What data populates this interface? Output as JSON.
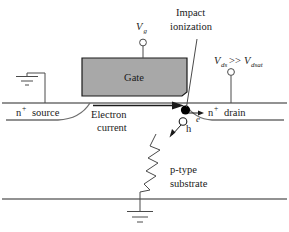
{
  "figure": {
    "background_color": "#ffffff"
  },
  "colors": {
    "gate_fill": "#a8a8a8",
    "gate_stroke": "#1a1a1a",
    "surface_line": "#6e6e6e",
    "text": "#1a1a1a",
    "carrier_electron": "#000000",
    "carrier_hole_fill": "#ffffff"
  },
  "labels": {
    "gate": "Gate",
    "gate_voltage": "V",
    "gate_voltage_sub": "g",
    "drain_bias_v1": "V",
    "drain_bias_v1_sub": "ds",
    "drain_bias_op": ">>",
    "drain_bias_v2": "V",
    "drain_bias_v2_sub": "dsat",
    "impact_line1": "Impact",
    "impact_line2": "ionization",
    "source_n": "n",
    "source_sup": "+",
    "source_word": "source",
    "drain_n": "n",
    "drain_sup": "+",
    "drain_word": "drain",
    "electron_current_line1": "Electron",
    "electron_current_line2": "current",
    "carrier_electron": "e",
    "carrier_hole": "h",
    "substrate_line1": "p-type",
    "substrate_line2": "substrate"
  },
  "elements": {
    "ground_source": "ground-symbol",
    "ground_substrate": "ground-symbol",
    "resistor": "zigzag-resistor",
    "terminal_gate": "open-circle-terminal",
    "terminal_drain": "open-circle-terminal",
    "current_arrow": "right-arrow",
    "electron_arrow": "right-arrow",
    "hole_arrow": "down-left-arrow",
    "leader_line": "annotation-leader"
  }
}
